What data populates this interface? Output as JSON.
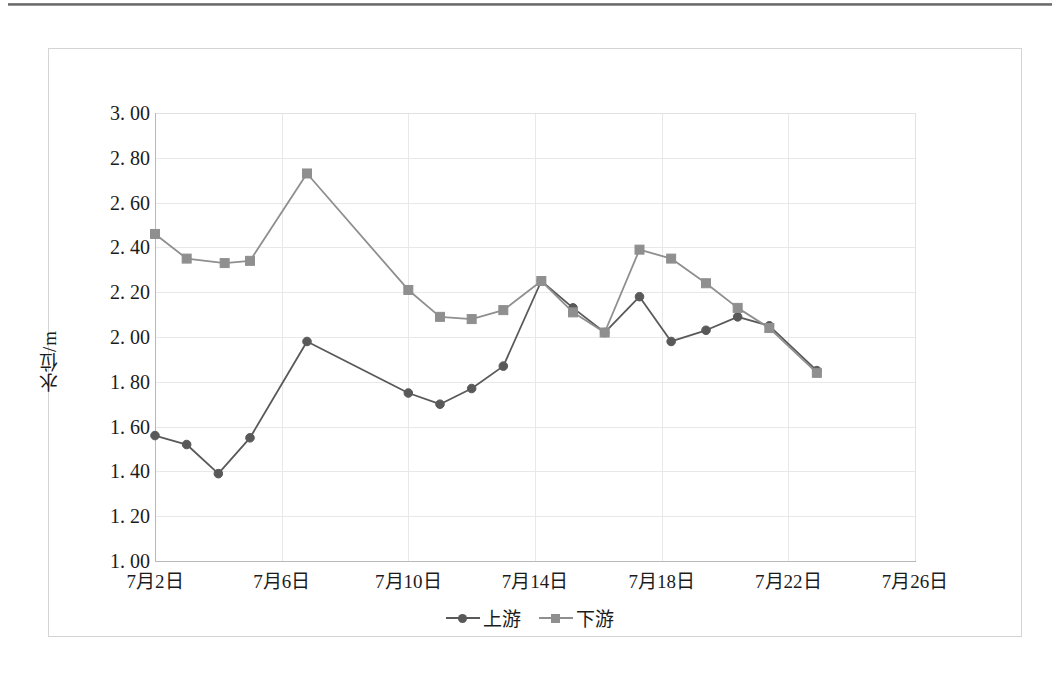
{
  "chart_data": {
    "type": "line",
    "title": "",
    "xlabel": "",
    "ylabel": "水位/m",
    "ylim": [
      1.0,
      3.0
    ],
    "ytick_step": 0.2,
    "ytick_labels": [
      "3. 00",
      "2. 80",
      "2. 60",
      "2. 40",
      "2. 20",
      "2. 00",
      "1. 80",
      "1. 60",
      "1. 40",
      "1. 20",
      "1. 00"
    ],
    "ytick_values": [
      3.0,
      2.8,
      2.6,
      2.4,
      2.2,
      2.0,
      1.8,
      1.6,
      1.4,
      1.2,
      1.0
    ],
    "xtick_labels": [
      "7月2日",
      "7月6日",
      "7月10日",
      "7月14日",
      "7月18日",
      "7月22日",
      "7月26日"
    ],
    "xtick_days": [
      2,
      6,
      10,
      14,
      18,
      22,
      26
    ],
    "xlim_days": [
      2,
      26
    ],
    "grid": true,
    "legend_position": "bottom",
    "x": [
      2,
      3,
      4,
      5,
      6,
      7,
      8,
      10,
      11,
      12,
      13,
      14,
      15,
      16,
      17,
      18,
      19,
      20,
      21,
      22,
      23
    ],
    "series": [
      {
        "name": "上游",
        "color": "#595959",
        "marker": "circle",
        "values": [
          1.56,
          1.52,
          1.39,
          1.55,
          1.98,
          null,
          null,
          1.75,
          1.7,
          1.77,
          1.87,
          2.25,
          2.13,
          2.02,
          2.18,
          1.98,
          2.03,
          2.09,
          2.05,
          1.85,
          null
        ]
      },
      {
        "name": "下游",
        "color": "#8f8f8f",
        "marker": "square",
        "values": [
          2.46,
          2.35,
          2.33,
          2.34,
          2.73,
          null,
          null,
          2.21,
          2.09,
          2.08,
          2.12,
          2.25,
          2.11,
          2.02,
          2.39,
          2.35,
          2.24,
          2.13,
          2.04,
          1.84,
          null
        ]
      }
    ],
    "upstream_points": [
      {
        "day": 2,
        "value": 1.56
      },
      {
        "day": 3,
        "value": 1.52
      },
      {
        "day": 4,
        "value": 1.39
      },
      {
        "day": 5,
        "value": 1.55
      },
      {
        "day": 6.8,
        "value": 1.98
      },
      {
        "day": 10,
        "value": 1.75
      },
      {
        "day": 11,
        "value": 1.7
      },
      {
        "day": 12,
        "value": 1.77
      },
      {
        "day": 13,
        "value": 1.87
      },
      {
        "day": 14.2,
        "value": 2.25
      },
      {
        "day": 15.2,
        "value": 2.13
      },
      {
        "day": 16.2,
        "value": 2.02
      },
      {
        "day": 17.3,
        "value": 2.18
      },
      {
        "day": 18.3,
        "value": 1.98
      },
      {
        "day": 19.4,
        "value": 2.03
      },
      {
        "day": 20.4,
        "value": 2.09
      },
      {
        "day": 21.4,
        "value": 2.05
      },
      {
        "day": 22.9,
        "value": 1.85
      }
    ],
    "downstream_points": [
      {
        "day": 2,
        "value": 2.46
      },
      {
        "day": 3,
        "value": 2.35
      },
      {
        "day": 4.2,
        "value": 2.33
      },
      {
        "day": 5,
        "value": 2.34
      },
      {
        "day": 6.8,
        "value": 2.73
      },
      {
        "day": 10,
        "value": 2.21
      },
      {
        "day": 11,
        "value": 2.09
      },
      {
        "day": 12,
        "value": 2.08
      },
      {
        "day": 13,
        "value": 2.12
      },
      {
        "day": 14.2,
        "value": 2.25
      },
      {
        "day": 15.2,
        "value": 2.11
      },
      {
        "day": 16.2,
        "value": 2.02
      },
      {
        "day": 17.3,
        "value": 2.39
      },
      {
        "day": 18.3,
        "value": 2.35
      },
      {
        "day": 19.4,
        "value": 2.24
      },
      {
        "day": 20.4,
        "value": 2.13
      },
      {
        "day": 21.4,
        "value": 2.04
      },
      {
        "day": 22.9,
        "value": 1.84
      }
    ],
    "legend": [
      {
        "label": "上游",
        "color": "#595959",
        "marker": "circle"
      },
      {
        "label": "下游",
        "color": "#8f8f8f",
        "marker": "square"
      }
    ]
  }
}
